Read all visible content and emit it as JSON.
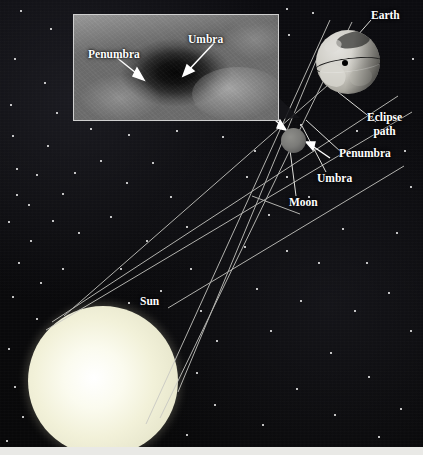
{
  "figure": {
    "background_color": "#0a0a0c",
    "sun_color": "#f2f1d9",
    "label_color": "#ffffff"
  },
  "bodies": {
    "sun": {
      "label": "Sun"
    },
    "moon": {
      "label": "Moon"
    },
    "earth": {
      "label": "Earth"
    }
  },
  "diagram_labels": {
    "earth": "Earth",
    "eclipse_path_line1": "Eclipse",
    "eclipse_path_line2": "path",
    "penumbra": "Penumbra",
    "umbra": "Umbra",
    "moon": "Moon",
    "sun": "Sun"
  },
  "inset_photo": {
    "caption_penumbra": "Penumbra",
    "caption_umbra": "Umbra",
    "description": "Satellite photograph of the Moon's shadow on Earth's cloud tops"
  }
}
